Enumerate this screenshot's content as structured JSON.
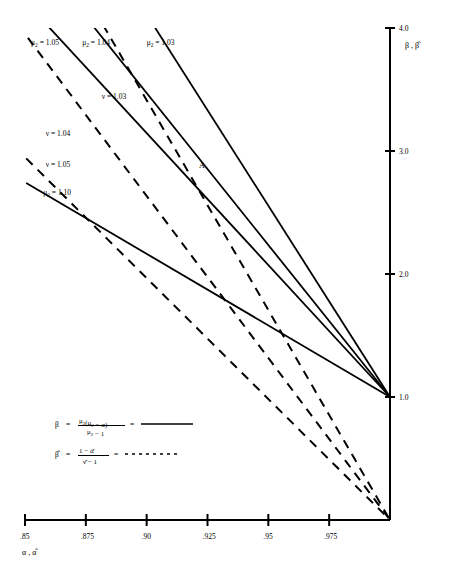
{
  "chart_data": {
    "type": "line",
    "title": "",
    "xlabel": "α , α̂",
    "ylabel": "β , β̂",
    "xlim": [
      0.85,
      1.0
    ],
    "ylim": [
      0.0,
      4.0
    ],
    "xticks": [
      0.85,
      0.875,
      0.9,
      0.925,
      0.95,
      0.975
    ],
    "xticklabels": [
      ".85",
      ".875",
      ".90",
      ".925",
      ".95",
      ".975"
    ],
    "yticks": [
      1.0,
      2.0,
      3.0,
      4.0
    ],
    "yticklabels": [
      "1.0",
      "2.0",
      "3.0",
      "4.0"
    ],
    "grid": false,
    "legend_position": "lower-left-inside",
    "annotations": [
      {
        "text": "A",
        "x": 0.9215,
        "y": 2.86
      }
    ],
    "series": [
      {
        "name": "μ₂ = 1.03",
        "style": "solid",
        "label_text": "μ₂ = 1.03",
        "label_x": 0.9,
        "label_y": 3.86,
        "points": [
          {
            "x": 0.8955,
            "y": 4.25
          },
          {
            "x": 1.0,
            "y": 1.0
          }
        ]
      },
      {
        "name": "μ₂ = 1.04",
        "style": "solid",
        "label_text": "μ₂ = 1.04",
        "label_x": 0.8735,
        "label_y": 3.86,
        "points": [
          {
            "x": 0.8685,
            "y": 4.25
          },
          {
            "x": 1.0,
            "y": 1.0
          }
        ]
      },
      {
        "name": "μ₂ = 1.05",
        "style": "solid",
        "label_text": "μ₂ = 1.05",
        "label_x": 0.8525,
        "label_y": 3.86,
        "points": [
          {
            "x": 0.8485,
            "y": 4.25
          },
          {
            "x": 1.0,
            "y": 1.0
          }
        ]
      },
      {
        "name": "μ₂ = 1.10",
        "style": "solid",
        "label_text": "μ₂ = 1.10",
        "label_x": 0.8575,
        "label_y": 2.64,
        "points": [
          {
            "x": 0.8505,
            "y": 2.74
          },
          {
            "x": 1.0,
            "y": 1.0
          }
        ]
      },
      {
        "name": "ν = 1.03",
        "style": "dashed",
        "label_text": "ν = 1.03",
        "label_x": 0.8815,
        "label_y": 3.42,
        "points": [
          {
            "x": 0.8755,
            "y": 4.25
          },
          {
            "x": 1.0,
            "y": 0.0
          }
        ]
      },
      {
        "name": "ν = 1.04",
        "style": "dashed",
        "label_text": "ν = 1.04",
        "label_x": 0.8585,
        "label_y": 3.12,
        "points": [
          {
            "x": 0.8512,
            "y": 3.92
          },
          {
            "x": 1.0,
            "y": 0.0
          }
        ]
      },
      {
        "name": "ν = 1.05",
        "style": "dashed",
        "label_text": "ν = 1.05",
        "label_x": 0.8585,
        "label_y": 2.87,
        "points": [
          {
            "x": 0.8505,
            "y": 2.94
          },
          {
            "x": 1.0,
            "y": 0.0
          }
        ]
      }
    ],
    "legend_entries": [
      {
        "lhs": "β",
        "num_main": "μ₂(μ₂ − α)",
        "den_main": "μ₂ − 1",
        "equals": "=",
        "sample_style": "solid"
      },
      {
        "lhs": "β̂",
        "num_main": "1 − α̂",
        "den_main": "ν̂ − 1",
        "equals": "=",
        "sample_style": "dotted"
      }
    ]
  }
}
